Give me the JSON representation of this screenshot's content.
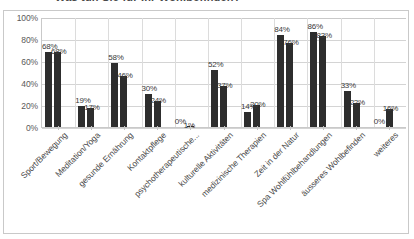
{
  "chart_title_partial": "Was tun Sie für Ihr Wohlbefinden?",
  "chart_data": {
    "type": "bar",
    "title": "Was tun Sie für Ihr Wohlbefinden?",
    "xlabel": "",
    "ylabel": "",
    "ylim": [
      0,
      100
    ],
    "yticks": [
      "0%",
      "20%",
      "40%",
      "60%",
      "80%",
      "100%"
    ],
    "ytick_values": [
      0,
      20,
      40,
      60,
      80,
      100
    ],
    "grid": true,
    "legend": "none",
    "value_suffix": "%",
    "categories": [
      "Sport/Bewegung",
      "Meditation/Yoga",
      "gesunde Ernährung",
      "Kontaktpflege",
      "psychotherapeutische...",
      "kulturelle Aktivitäten",
      "medizinische Therapien",
      "Zeit in der Natur",
      "Spa Wohlfühlbehandlungen",
      "äusseres Wohlbefinden",
      "weiteres"
    ],
    "series": [
      {
        "name": "Serie 1",
        "values": [
          68,
          19,
          58,
          30,
          0,
          52,
          14,
          84,
          86,
          33,
          0
        ],
        "labels": [
          "68%",
          "19%",
          "58%",
          "30%",
          "0%",
          "52%",
          "14%",
          "84%",
          "86%",
          "33%",
          "0%"
        ]
      },
      {
        "name": "Serie 2",
        "values": [
          68,
          17,
          46,
          24,
          1,
          37,
          20,
          76,
          83,
          22,
          16
        ],
        "labels": [
          "68%",
          "17%",
          "46%",
          "24%",
          "1%",
          "37%",
          "20%",
          "76%",
          "83%",
          "22%",
          "16%"
        ]
      }
    ],
    "colors": {
      "bar": "#2d2d2d",
      "gridline": "#d4d4d4",
      "plot_background": "#ffffff",
      "border": "#c9c9c9",
      "label_text": "#3a3a3a"
    }
  }
}
